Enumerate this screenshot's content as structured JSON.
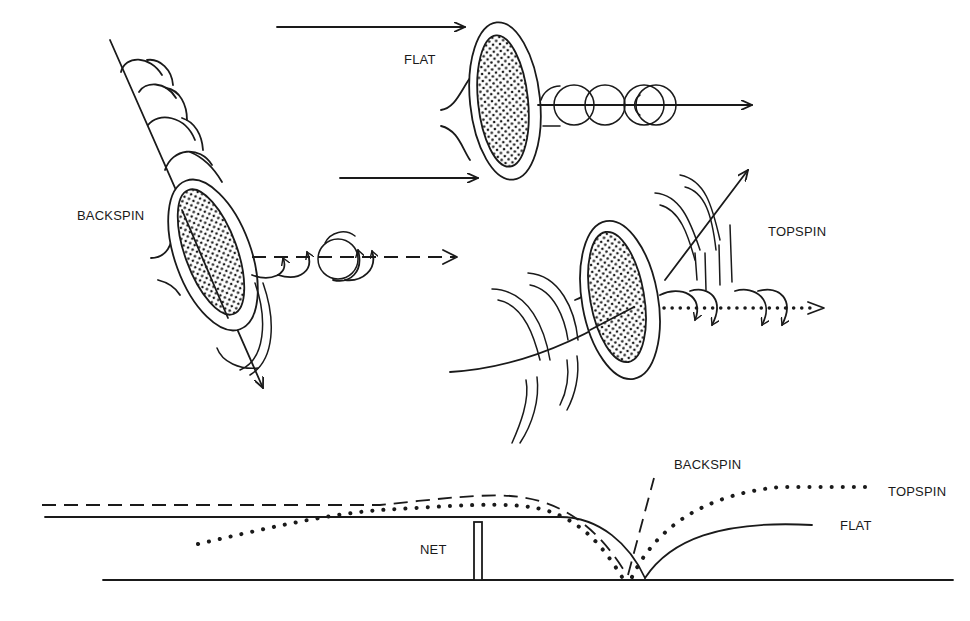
{
  "figure": {
    "panels": {
      "flat": {
        "label": "FLAT"
      },
      "backspin": {
        "label": "BACKSPIN"
      },
      "topspin": {
        "label": "TOPSPIN"
      }
    },
    "trajectory_diagram": {
      "net_label": "NET",
      "curves": [
        {
          "name": "BACKSPIN",
          "style": "dashed",
          "label": "BACKSPIN"
        },
        {
          "name": "TOPSPIN",
          "style": "dotted",
          "label": "TOPSPIN"
        },
        {
          "name": "FLAT",
          "style": "solid",
          "label": "FLAT"
        }
      ]
    },
    "colors": {
      "ink": "#1a1a1a",
      "background": "#ffffff"
    }
  }
}
